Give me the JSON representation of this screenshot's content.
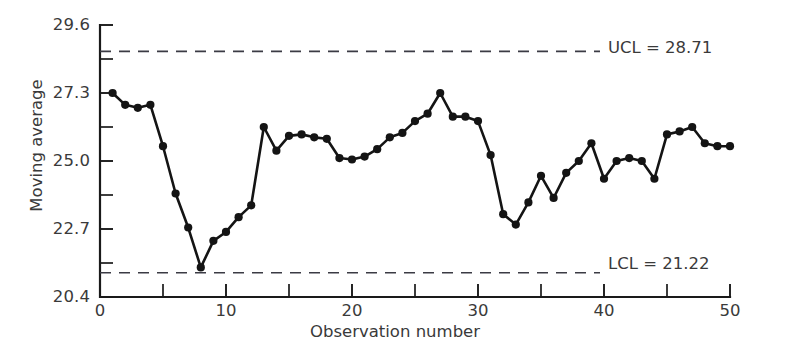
{
  "chart_data": {
    "type": "line",
    "title": "",
    "xlabel": "Observation number",
    "ylabel": "Moving average",
    "x": [
      1,
      2,
      3,
      4,
      5,
      6,
      7,
      8,
      9,
      10,
      11,
      12,
      13,
      14,
      15,
      16,
      17,
      18,
      19,
      20,
      21,
      22,
      23,
      24,
      25,
      26,
      27,
      28,
      29,
      30,
      31,
      32,
      33,
      34,
      35,
      36,
      37,
      38,
      39,
      40,
      41,
      42,
      43,
      44,
      45,
      46,
      47,
      48,
      49,
      50
    ],
    "values": [
      27.3,
      26.9,
      26.8,
      26.9,
      25.5,
      23.9,
      22.75,
      21.4,
      22.3,
      22.6,
      23.1,
      23.5,
      26.15,
      25.35,
      25.85,
      25.9,
      25.8,
      25.75,
      25.1,
      25.05,
      25.15,
      25.4,
      25.8,
      25.95,
      26.35,
      26.6,
      27.3,
      26.5,
      26.5,
      26.35,
      25.2,
      23.2,
      22.85,
      23.6,
      24.5,
      23.75,
      24.6,
      25.0,
      25.6,
      24.4,
      25.0,
      25.1,
      25.0,
      24.4,
      25.9,
      26.0,
      26.15,
      25.6,
      25.5,
      25.5
    ],
    "xlim": [
      0,
      50
    ],
    "ylim": [
      20.4,
      29.6
    ],
    "x_ticks": [
      0,
      10,
      20,
      30,
      40,
      50
    ],
    "x_tick_labels": [
      "0",
      "10",
      "20",
      "30",
      "40",
      "50"
    ],
    "x_minor_ticks": [
      5,
      15,
      25,
      35,
      45
    ],
    "y_ticks": [
      20.4,
      22.7,
      25.0,
      27.3,
      29.6
    ],
    "y_tick_labels": [
      "20.4",
      "22.7",
      "25.0",
      "27.3",
      "29.6"
    ],
    "y_minor_ticks": [
      21.55,
      23.85,
      26.15,
      28.45
    ],
    "grid": false,
    "legend": false,
    "marker": "filled-circle",
    "line_color": "#141414",
    "control_limits": [
      {
        "name": "UCL",
        "label": "UCL = 28.71",
        "value": 28.71,
        "style": "dashed",
        "color": "#3b3b44"
      },
      {
        "name": "LCL",
        "label": "LCL = 21.22",
        "value": 21.22,
        "style": "dashed",
        "color": "#3b3b44"
      }
    ]
  },
  "axes": {
    "y_title": "Moving average",
    "x_title": "Observation number"
  },
  "annotations": {
    "ucl": "UCL = 28.71",
    "lcl": "LCL = 21.22"
  }
}
